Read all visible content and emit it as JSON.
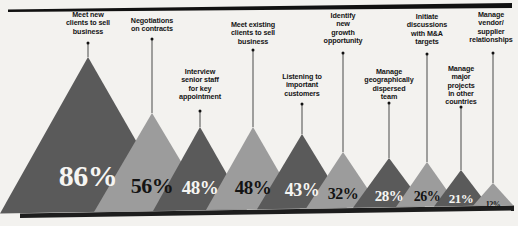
{
  "chart_data": {
    "type": "bar",
    "title": "",
    "subtitle": "",
    "xlabel": "",
    "ylabel": "",
    "ylim": [
      0,
      100
    ],
    "grid": false,
    "legend": "none",
    "note": "Triangle / mountain chart: each category drawn as an isosceles triangle whose height encodes the percentage. Alternating dark-grey and light-grey fills; value printed inside each triangle; category label above, connected by a thin leader line ending in a dot at the apex.",
    "categories": [
      "Meet new clients to sell business",
      "Negotiations on contracts",
      "Interview senior staff for key appointment",
      "Meet existing clients to sell business",
      "Listening to important customers",
      "Identify new growth opportunity",
      "Manage geographically dispersed team",
      "Initiate discussions with M&A targets",
      "Manage major projects in other countries",
      "Manage vendor/ supplier relationships"
    ],
    "values": [
      86,
      56,
      48,
      48,
      43,
      32,
      28,
      26,
      21,
      12
    ],
    "value_labels": [
      "86%",
      "56%",
      "48%",
      "48%",
      "43%",
      "32%",
      "28%",
      "26%",
      "21%",
      "12%"
    ]
  },
  "palette": {
    "background": "#f3f2ef",
    "dark_fill": "#5a5a5a",
    "light_fill": "#9c9c9c",
    "rule": "#111111",
    "leader": "#4a4a4a",
    "text_dark": "#141414",
    "text_light": "#f6f5f2"
  },
  "peaks": [
    {
      "label": "Meet new\nclients to sell\nbusiness",
      "value_label": "86%",
      "value": 86,
      "fill": "dark",
      "cx": 88,
      "half_width": 88,
      "apex_y": 57,
      "label_x": 88,
      "label_y": 11,
      "leader_top": 43,
      "leader_height": 14,
      "pct_x": 88,
      "pct_y": 176,
      "pct_size": 30
    },
    {
      "label": "Negotiations\non contracts",
      "value_label": "56%",
      "value": 56,
      "fill": "light",
      "cx": 152,
      "half_width": 58,
      "apex_y": 113,
      "label_x": 152,
      "label_y": 17,
      "leader_top": 39,
      "leader_height": 74,
      "pct_x": 152,
      "pct_y": 186,
      "pct_size": 22
    },
    {
      "label": "Interview\nsenior staff\nfor key\nappointment",
      "value_label": "48%",
      "value": 48,
      "fill": "dark",
      "cx": 200,
      "half_width": 47,
      "apex_y": 127,
      "label_x": 200,
      "label_y": 68,
      "leader_top": 111,
      "leader_height": 16,
      "pct_x": 200,
      "pct_y": 188,
      "pct_size": 19
    },
    {
      "label": "Meet existing\nclients to sell\nbusiness",
      "value_label": "48%",
      "value": 48,
      "fill": "light",
      "cx": 253,
      "half_width": 47,
      "apex_y": 127,
      "label_x": 253,
      "label_y": 21,
      "leader_top": 50,
      "leader_height": 77,
      "pct_x": 253,
      "pct_y": 188,
      "pct_size": 19
    },
    {
      "label": "Listening to\nimportant\ncustomers",
      "value_label": "43%",
      "value": 43,
      "fill": "dark",
      "fill_override": "dark",
      "cx": 302,
      "half_width": 45,
      "apex_y": 134,
      "label_x": 302,
      "label_y": 73,
      "leader_top": 104,
      "leader_height": 30,
      "pct_x": 302,
      "pct_y": 190,
      "pct_size": 18
    },
    {
      "label": "Identify\nnew\ngrowth\nopportunity",
      "value_label": "32%",
      "value": 32,
      "fill": "light",
      "cx": 343,
      "half_width": 37,
      "apex_y": 152,
      "label_x": 343,
      "label_y": 12,
      "leader_top": 53,
      "leader_height": 99,
      "pct_x": 343,
      "pct_y": 194,
      "pct_size": 16
    },
    {
      "label": "Manage\ngeographically\ndispersed\nteam",
      "value_label": "28%",
      "value": 28,
      "fill": "dark",
      "cx": 389,
      "half_width": 36,
      "apex_y": 158,
      "label_x": 389,
      "label_y": 68,
      "leader_top": 103,
      "leader_height": 55,
      "pct_x": 389,
      "pct_y": 196,
      "pct_size": 15
    },
    {
      "label": "Initiate\ndiscussions\nwith M&A\ntargets",
      "value_label": "26%",
      "value": 26,
      "fill": "light",
      "cx": 427,
      "half_width": 31,
      "apex_y": 162,
      "label_x": 427,
      "label_y": 13,
      "leader_top": 54,
      "leader_height": 108,
      "pct_x": 427,
      "pct_y": 197,
      "pct_size": 14
    },
    {
      "label": "Manage\nmajor\nprojects\nin other\ncountries",
      "value_label": "21%",
      "value": 21,
      "fill": "dark",
      "cx": 461,
      "half_width": 27,
      "apex_y": 170,
      "label_x": 461,
      "label_y": 65,
      "leader_top": 107,
      "leader_height": 63,
      "pct_x": 461,
      "pct_y": 199,
      "pct_size": 13
    },
    {
      "label": "Manage\nvendor/\nsupplier\nrelationships",
      "value_label": "12%",
      "value": 12,
      "fill": "light",
      "cx": 493,
      "half_width": 20,
      "apex_y": 183,
      "label_x": 491,
      "label_y": 11,
      "leader_top": 53,
      "leader_height": 130,
      "pct_x": 493,
      "pct_y": 204,
      "pct_size": 8
    }
  ]
}
